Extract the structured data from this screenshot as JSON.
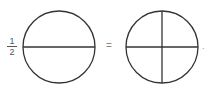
{
  "fraction": {
    "numerator": "1",
    "denominator": "2"
  },
  "operator": "=",
  "trailing": "·",
  "diagrams": [
    {
      "name": "circle-halves",
      "parts": 2,
      "cx": 59,
      "cy": 47,
      "r": 36
    },
    {
      "name": "circle-quarters",
      "parts": 4,
      "cx": 162,
      "cy": 47,
      "r": 36
    }
  ],
  "colors": {
    "stroke": "#333333"
  }
}
